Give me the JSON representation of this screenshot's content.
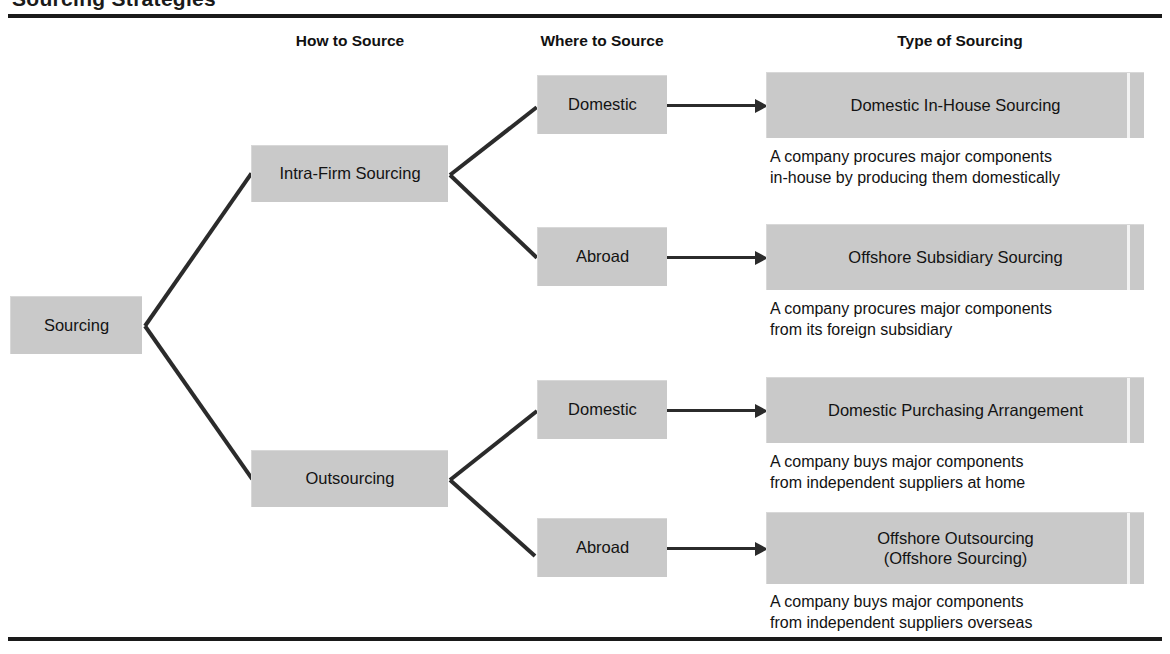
{
  "figure": {
    "title_partial": "Sourcing Strategies",
    "columns": [
      {
        "label": "How to Source",
        "left": 250,
        "width": 200
      },
      {
        "label": "Where to Source",
        "left": 515,
        "width": 180
      },
      {
        "label": "Type of Sourcing",
        "left": 760,
        "width": 400
      }
    ]
  },
  "root": {
    "label": "Sourcing"
  },
  "how_to_source": [
    {
      "label": "Intra-Firm Sourcing"
    },
    {
      "label": "Outsourcing"
    }
  ],
  "where_to_source": [
    {
      "label": "Domestic"
    },
    {
      "label": "Abroad"
    },
    {
      "label": "Domestic"
    },
    {
      "label": "Abroad"
    }
  ],
  "types": [
    {
      "label": "Domestic In-House Sourcing",
      "description": "A company procures major components\nin-house by producing them domestically"
    },
    {
      "label": "Offshore Subsidiary Sourcing",
      "description": "A company procures major components\nfrom its foreign subsidiary"
    },
    {
      "label": "Domestic Purchasing Arrangement",
      "description": "A company buys major components\nfrom independent suppliers at home"
    },
    {
      "label": "Offshore Outsourcing\n(Offshore Sourcing)",
      "description": "A company buys major components\nfrom independent suppliers overseas"
    }
  ],
  "colors": {
    "box_fill": "#c9c9c9",
    "box_shadow": "#6f6f6f",
    "line": "#2b2b2b",
    "rule": "#1a1a1a",
    "text": "#121212",
    "background": "#ffffff",
    "pinstripe": "#f3f3f3"
  }
}
